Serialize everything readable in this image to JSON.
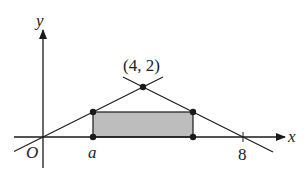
{
  "diagram": {
    "axes": {
      "x_label": "x",
      "y_label": "y",
      "origin_label": "O"
    },
    "peak_label": "(4, 2)",
    "tick_labels": {
      "a": "a",
      "eight": "8"
    },
    "colors": {
      "line": "#1a1a1a",
      "rect_fill": "#bdbdbd"
    },
    "points": {
      "peak": [
        4,
        2
      ],
      "left_top": [
        "a",
        "a/2"
      ],
      "right_top": [
        "8-a",
        "a/2"
      ],
      "x_intercept": [
        8,
        0
      ]
    }
  }
}
